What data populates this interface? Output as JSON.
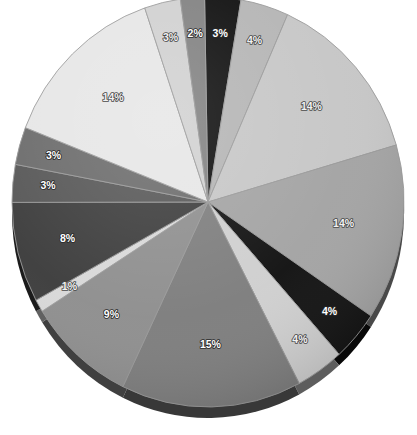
{
  "chart_data": {
    "type": "pie",
    "title": "",
    "subtitle": "",
    "xlabel": "",
    "ylabel": "",
    "legend": false,
    "legend_position": "none",
    "grid": false,
    "style": "3d-shaded-grayscale",
    "value_suffix": "%",
    "total": 101,
    "start_angle_deg": -91,
    "direction": "clockwise",
    "categories": [
      "Slice 1",
      "Slice 2",
      "Slice 3",
      "Slice 4",
      "Slice 5",
      "Slice 6",
      "Slice 7",
      "Slice 8",
      "Slice 9",
      "Slice 10",
      "Slice 11",
      "Slice 12",
      "Slice 13",
      "Slice 14",
      "Slice 15"
    ],
    "values": [
      3,
      4,
      14,
      14,
      4,
      4,
      15,
      9,
      1,
      8,
      3,
      3,
      14,
      3,
      2
    ],
    "labels": [
      "3%",
      "4%",
      "14%",
      "14%",
      "4%",
      "4%",
      "15%",
      "9%",
      "1%",
      "8%",
      "3%",
      "3%",
      "14%",
      "3%",
      "2%"
    ],
    "colors": [
      "#0d0d0d",
      "#b4b4b4",
      "#c6c6c6",
      "#a3a3a3",
      "#111111",
      "#cfcfcf",
      "#7d7d7d",
      "#8e8e8e",
      "#d8d8d8",
      "#3c3c3c",
      "#565656",
      "#6a6a6a",
      "#e6e6e6",
      "#d0d0d0",
      "#808080"
    ],
    "label_tone": [
      "dark",
      "light",
      "light",
      "light",
      "dark",
      "light",
      "dark",
      "dark",
      "light",
      "dark",
      "dark",
      "dark",
      "light",
      "light",
      "dark"
    ],
    "geometry": {
      "center_x": 208,
      "center_y": 202,
      "radius_x": 196,
      "radius_y": 205,
      "depth": 11
    }
  }
}
